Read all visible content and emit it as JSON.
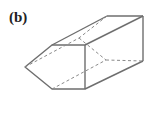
{
  "figure": {
    "label": "(b)",
    "stroke_color": "#6e6e6e",
    "hidden_color": "#8a8a8a"
  }
}
